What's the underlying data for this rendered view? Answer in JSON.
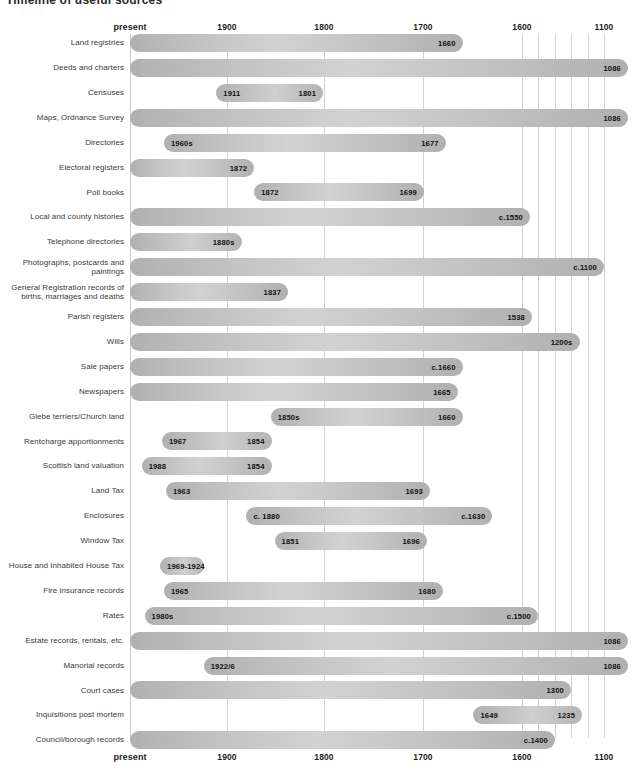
{
  "title": "Timeline of useful sources",
  "axis": {
    "present_label": "present",
    "ticks": [
      {
        "label": "present",
        "year": 2000
      },
      {
        "label": "1900",
        "year": 1900
      },
      {
        "label": "1800",
        "year": 1800
      },
      {
        "label": "1700",
        "year": 1700
      },
      {
        "label": "1600",
        "year": 1600
      },
      {
        "label": "1100",
        "year": 1100
      }
    ],
    "gridline_years": [
      1900,
      1800,
      1700,
      1600,
      1500,
      1400,
      1300,
      1200,
      1100
    ]
  },
  "chart_data": {
    "type": "bar",
    "title": "Timeline of useful sources",
    "xlabel": "",
    "ylabel": "",
    "orientation": "horizontal-range",
    "note": "Horizontal range (Gantt-style) bars; x axis runs from present (left) back to 1100 (right), non-linear compression before 1600",
    "xlim": [
      2000,
      1100
    ],
    "grid": true,
    "legend": "none",
    "categories": [
      "Land registries",
      "Deeds and charters",
      "Censuses",
      "Maps, Ordnance Survey",
      "Directories",
      "Electoral registers",
      "Poll books",
      "Local and county histories",
      "Telephone directories",
      "Photographs, postcards and paintings",
      "General Registration records of births, marriages and deaths",
      "Parish registers",
      "Wills",
      "Sale papers",
      "Newspapers",
      "Glebe terriers/Church land",
      "Rentcharge apportionments",
      "Scottish land valuation",
      "Land Tax",
      "Enclosures",
      "Window Tax",
      "House and Inhabited House Tax",
      "Fire insurance records",
      "Rates",
      "Estate records, rentals, etc.",
      "Manorial records",
      "Court cases",
      "Inquisitions post mortem",
      "Council/borough records"
    ],
    "bars": [
      {
        "label": "Land registries",
        "start_year": 2000,
        "end_year": 1660,
        "start_text": "",
        "end_text": "1660"
      },
      {
        "label": "Deeds and charters",
        "start_year": 2000,
        "end_year": 1086,
        "start_text": "",
        "end_text": "1086"
      },
      {
        "label": "Censuses",
        "start_year": 1911,
        "end_year": 1801,
        "start_text": "1911",
        "end_text": "1801"
      },
      {
        "label": "Maps, Ordnance Survey",
        "start_year": 2000,
        "end_year": 1086,
        "start_text": "",
        "end_text": "1086"
      },
      {
        "label": "Directories",
        "start_year": 1965,
        "end_year": 1677,
        "start_text": "1960s",
        "end_text": "1677"
      },
      {
        "label": "Electoral registers",
        "start_year": 2000,
        "end_year": 1872,
        "start_text": "",
        "end_text": "1872"
      },
      {
        "label": "Poll books",
        "start_year": 1872,
        "end_year": 1699,
        "start_text": "1872",
        "end_text": "1699"
      },
      {
        "label": "Local and county histories",
        "start_year": 2000,
        "end_year": 1550,
        "start_text": "",
        "end_text": "c.1550"
      },
      {
        "label": "Telephone directories",
        "start_year": 2000,
        "end_year": 1885,
        "start_text": "",
        "end_text": "1880s"
      },
      {
        "label": "Photographs, postcards and paintings",
        "start_year": 2000,
        "end_year": 1100,
        "start_text": "",
        "end_text": "c.1100"
      },
      {
        "label": "General Registration records of births, marriages and deaths",
        "start_year": 2000,
        "end_year": 1837,
        "start_text": "",
        "end_text": "1837"
      },
      {
        "label": "Parish registers",
        "start_year": 2000,
        "end_year": 1538,
        "start_text": "",
        "end_text": "1538"
      },
      {
        "label": "Wills",
        "start_year": 2000,
        "end_year": 1250,
        "start_text": "",
        "end_text": "1200s"
      },
      {
        "label": "Sale papers",
        "start_year": 2000,
        "end_year": 1660,
        "start_text": "",
        "end_text": "c.1660"
      },
      {
        "label": "Newspapers",
        "start_year": 2000,
        "end_year": 1665,
        "start_text": "",
        "end_text": "1665"
      },
      {
        "label": "Glebe terriers/Church land",
        "start_year": 1855,
        "end_year": 1660,
        "start_text": "1850s",
        "end_text": "1660"
      },
      {
        "label": "Rentcharge apportionments",
        "start_year": 1967,
        "end_year": 1854,
        "start_text": "1967",
        "end_text": "1854"
      },
      {
        "label": "Scottish land valuation",
        "start_year": 1988,
        "end_year": 1854,
        "start_text": "1988",
        "end_text": "1854"
      },
      {
        "label": "Land Tax",
        "start_year": 1963,
        "end_year": 1693,
        "start_text": "1963",
        "end_text": "1693"
      },
      {
        "label": "Enclosures",
        "start_year": 1880,
        "end_year": 1630,
        "start_text": "c. 1880",
        "end_text": "c.1630"
      },
      {
        "label": "Window Tax",
        "start_year": 1851,
        "end_year": 1696,
        "start_text": "1851",
        "end_text": "1696"
      },
      {
        "label": "House and Inhabited House Tax",
        "start_year": 1969,
        "end_year": 1924,
        "start_text": "1969-1924",
        "end_text": ""
      },
      {
        "label": "Fire insurance records",
        "start_year": 1965,
        "end_year": 1680,
        "start_text": "1965",
        "end_text": "1680"
      },
      {
        "label": "Rates",
        "start_year": 1985,
        "end_year": 1500,
        "start_text": "1980s",
        "end_text": "c.1500"
      },
      {
        "label": "Estate records, rentals, etc.",
        "start_year": 2000,
        "end_year": 1086,
        "start_text": "",
        "end_text": "1086"
      },
      {
        "label": "Manorial records",
        "start_year": 1924,
        "end_year": 1086,
        "start_text": "1922/6",
        "end_text": "1086"
      },
      {
        "label": "Court cases",
        "start_year": 2000,
        "end_year": 1300,
        "start_text": "",
        "end_text": "1300"
      },
      {
        "label": "Inquisitions post mortem",
        "start_year": 1649,
        "end_year": 1235,
        "start_text": "1649",
        "end_text": "1235"
      },
      {
        "label": "Council/borough records",
        "start_year": 2000,
        "end_year": 1400,
        "start_text": "",
        "end_text": "c.1400"
      }
    ]
  },
  "geometry": {
    "plot_left_px": 130,
    "plot_right_px": 628,
    "row_top_px": 34,
    "row_pitch_px": 24.9,
    "bar_height_px": 18,
    "axis_top_px": 22,
    "axis_bottom_px": 752,
    "scale_anchors": [
      {
        "year": 2000,
        "px": 130
      },
      {
        "year": 1900,
        "px": 227
      },
      {
        "year": 1800,
        "px": 324
      },
      {
        "year": 1700,
        "px": 423
      },
      {
        "year": 1600,
        "px": 522
      },
      {
        "year": 1500,
        "px": 538
      },
      {
        "year": 1400,
        "px": 555
      },
      {
        "year": 1300,
        "px": 571
      },
      {
        "year": 1200,
        "px": 588
      },
      {
        "year": 1100,
        "px": 604
      },
      {
        "year": 1086,
        "px": 628
      }
    ]
  },
  "colors": {
    "bar_base": "#b8b8b8",
    "bar_highlight": "#d2d2d2",
    "gridline": "#d2d2d2",
    "label_text": "#3a3a3a",
    "tick_text": "#1d1d1d",
    "background": "#ffffff"
  }
}
